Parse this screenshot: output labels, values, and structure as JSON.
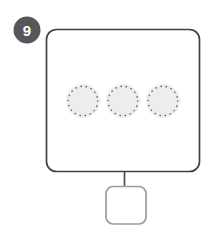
{
  "figure": {
    "badge_label": "9"
  },
  "diagram": {
    "dotted_circle_count": 3
  },
  "colors": {
    "background": "#ffffff",
    "badge_fill": "#56575a",
    "badge_text": "#ffffff",
    "outer_box_stroke": "#414143",
    "outer_box_fill": "#ffffff",
    "connector_stroke": "#4e4e50",
    "small_box_stroke": "#9c9c9c",
    "small_box_fill": "#ffffff",
    "dotted_circle_fill": "#ededed",
    "dot_color": "#636365"
  }
}
